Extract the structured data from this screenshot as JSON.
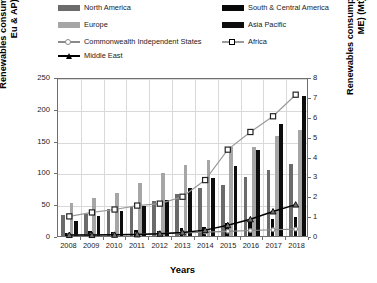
{
  "legend": {
    "items": [
      {
        "label": "North America",
        "marker": "bar",
        "color": "#6b6b6b",
        "col": 0,
        "row": 0
      },
      {
        "label": "South & Central America",
        "marker": "bar",
        "color": "#080808",
        "col": 1,
        "row": 0
      },
      {
        "label": "Europe",
        "marker": "bar",
        "color": "#a6a6a6",
        "col": 0,
        "row": 1
      },
      {
        "label": "Asia Pacific",
        "marker": "bar",
        "color": "#0d0d0d",
        "col": 1,
        "row": 1
      },
      {
        "label": "Commonwealth Independent States",
        "marker": "line-circle",
        "color": "#8a8a8a",
        "col": 0,
        "row": 2
      },
      {
        "label": "Africa",
        "marker": "line-square",
        "color": "#9a9a9a",
        "col": 1,
        "row": 2
      },
      {
        "label": "Middle East",
        "marker": "line-triangle",
        "color": "#000000",
        "col": 0,
        "row": 3
      }
    ]
  },
  "axes": {
    "x_label": "Years",
    "y_left_label": "Renewables consumption (NA, SCA, Eu & AP) (Mt)",
    "y_right_label": "Renewables consumption (CIS, Af & ME) (Mt)",
    "x_ticks": [
      "2008",
      "2009",
      "2010",
      "2011",
      "2012",
      "2013",
      "2014",
      "2015",
      "2016",
      "2017",
      "2018"
    ],
    "y_left_ticks": [
      "0",
      "50",
      "100",
      "150",
      "200",
      "250"
    ],
    "y_right_ticks": [
      "0",
      "1",
      "2",
      "3",
      "4",
      "5",
      "6",
      "7",
      "8"
    ]
  },
  "chart_data": {
    "type": "bar",
    "title": "",
    "xlabel": "Years",
    "ylabel": "Renewables consumption (NA, SCA, Eu & AP) (Mt)",
    "ylabel_secondary": "Renewables consumption (CIS, Af & ME) (Mt)",
    "categories": [
      "2008",
      "2009",
      "2010",
      "2011",
      "2012",
      "2013",
      "2014",
      "2015",
      "2016",
      "2017",
      "2018"
    ],
    "ylim": [
      0,
      250
    ],
    "ylim_secondary": [
      0,
      8
    ],
    "grid": true,
    "legend_position": "top",
    "series": [
      {
        "name": "North America",
        "type": "bar",
        "axis": "left",
        "color": "#6b6b6b",
        "values": [
          33,
          34,
          42,
          45,
          55,
          66,
          75,
          80,
          93,
          104,
          113
        ]
      },
      {
        "name": "South & Central America",
        "type": "bar",
        "axis": "left",
        "color": "#080808",
        "values": [
          4,
          8,
          6,
          10,
          8,
          12,
          14,
          20,
          22,
          26,
          30
        ]
      },
      {
        "name": "Europe",
        "type": "bar",
        "axis": "left",
        "color": "#a6a6a6",
        "values": [
          52,
          59,
          68,
          84,
          99,
          112,
          120,
          140,
          140,
          157,
          167
        ]
      },
      {
        "name": "Asia Pacific",
        "type": "bar",
        "axis": "left",
        "color": "#0d0d0d",
        "values": [
          24,
          31,
          39,
          47,
          57,
          76,
          92,
          110,
          136,
          176,
          220
        ]
      },
      {
        "name": "Commonwealth Independent States",
        "type": "line",
        "axis": "right",
        "color": "#8a8a8a",
        "marker": "circle",
        "values": [
          0.05,
          0.06,
          0.07,
          0.09,
          0.12,
          0.16,
          0.2,
          0.24,
          0.28,
          0.32,
          0.35
        ]
      },
      {
        "name": "Africa",
        "type": "line",
        "axis": "right",
        "color": "#9a9a9a",
        "marker": "square",
        "values": [
          1.0,
          1.2,
          1.35,
          1.55,
          1.65,
          2.0,
          2.85,
          4.4,
          5.3,
          6.1,
          7.2
        ]
      },
      {
        "name": "Middle East",
        "type": "line",
        "axis": "right",
        "color": "#000000",
        "marker": "triangle",
        "values": [
          0.05,
          0.05,
          0.06,
          0.08,
          0.12,
          0.18,
          0.3,
          0.55,
          0.85,
          1.25,
          1.6
        ]
      }
    ]
  }
}
